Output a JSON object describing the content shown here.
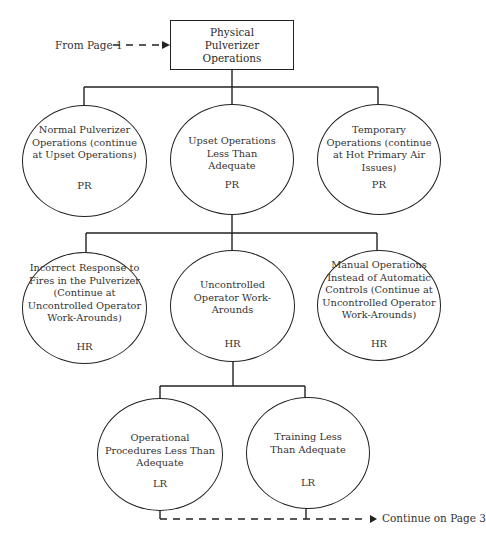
{
  "root": {
    "label": "Physical Pulverizer Operations"
  },
  "incoming": {
    "label": "From Page 1"
  },
  "outgoing": {
    "label": "Continue on Page 3"
  },
  "level1": [
    {
      "label": "Normal Pulverizer Operations (continue at Upset Operations)",
      "rating": "PR"
    },
    {
      "label": "Upset Operations Less Than Adequate",
      "rating": "PR"
    },
    {
      "label": "Temporary Operations (continue at Hot Primary Air Issues)",
      "rating": "PR"
    }
  ],
  "level2": [
    {
      "label": "Incorrect Response to Fires in the Pulverizer (Continue at Uncontrolled Operator Work-Arounds)",
      "rating": "HR"
    },
    {
      "label": "Uncontrolled Operator Work-Arounds",
      "rating": "HR"
    },
    {
      "label": "Manual Operations Instead of Automatic Controls (Continue at Uncontrolled Operator Work-Arounds)",
      "rating": "HR"
    }
  ],
  "level3": [
    {
      "label": "Operational Procedures Less Than Adequate",
      "rating": "LR"
    },
    {
      "label": "Training Less Than Adequate",
      "rating": "LR"
    }
  ]
}
